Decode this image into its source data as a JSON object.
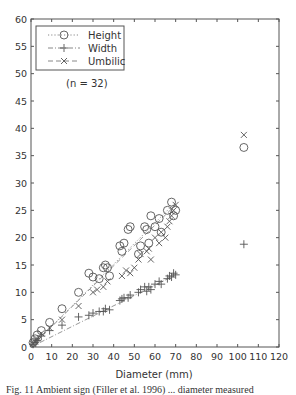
{
  "chart_data": {
    "type": "scatter",
    "title": "",
    "xlabel": "Diameter (mm)",
    "ylabel": "",
    "xlim": [
      0,
      120
    ],
    "ylim": [
      0,
      60
    ],
    "xticks": [
      0,
      10,
      20,
      30,
      40,
      50,
      60,
      70,
      80,
      90,
      100,
      110,
      120
    ],
    "yticks": [
      0,
      5,
      10,
      15,
      20,
      25,
      30,
      35,
      40,
      45,
      50,
      55,
      60
    ],
    "grid": false,
    "legend_position": "upper left",
    "annotation": "(n = 32)",
    "series": [
      {
        "name": "Height",
        "marker": "circle",
        "line": "dotted",
        "x": [
          1,
          2,
          3,
          5,
          9,
          15,
          23,
          28,
          30,
          33,
          35,
          36,
          37,
          38,
          43,
          44,
          45,
          47,
          48,
          52,
          53,
          55,
          56,
          57,
          58,
          60,
          62,
          63,
          66,
          68,
          69,
          70,
          103
        ],
        "y": [
          0.8,
          1.5,
          2.2,
          3,
          4.5,
          7,
          10,
          13.5,
          12.8,
          12.5,
          14.5,
          15,
          14.5,
          13,
          18.5,
          17.5,
          19,
          21.5,
          22,
          17,
          18.5,
          22,
          21.5,
          19,
          24,
          22,
          23.5,
          21,
          25,
          26.5,
          24,
          25,
          36.5
        ]
      },
      {
        "name": "Width",
        "marker": "plus",
        "line": "dash-dot",
        "x": [
          1,
          2,
          3,
          5,
          9,
          15,
          23,
          28,
          30,
          33,
          35,
          36,
          38,
          43,
          44,
          45,
          47,
          48,
          52,
          53,
          55,
          56,
          57,
          58,
          60,
          62,
          63,
          66,
          67,
          68,
          69,
          70,
          103
        ],
        "y": [
          0.5,
          0.8,
          1.2,
          2,
          3,
          4,
          5.5,
          5.8,
          6.2,
          6.5,
          6.5,
          7,
          6.8,
          8.5,
          8.8,
          9,
          9,
          9.5,
          10,
          10.5,
          11,
          10.2,
          11,
          10.5,
          11.5,
          12,
          11.5,
          12.5,
          13,
          12.8,
          13.5,
          13.2,
          18.8
        ]
      },
      {
        "name": "Umbilic",
        "marker": "x",
        "line": "dashed",
        "x": [
          1,
          2,
          3,
          5,
          9,
          15,
          23,
          30,
          32,
          35,
          37,
          44,
          46,
          48,
          50,
          52,
          53,
          56,
          57,
          58,
          60,
          62,
          63,
          65,
          66,
          67,
          68,
          69,
          70,
          103
        ],
        "y": [
          0.6,
          1,
          1.5,
          2.5,
          3.5,
          5,
          7.5,
          10,
          10.5,
          11,
          12,
          13,
          14,
          13.5,
          14.5,
          16,
          17,
          17.5,
          18,
          16,
          20,
          19,
          21,
          20,
          22,
          23,
          24,
          25,
          26,
          38.8
        ]
      }
    ],
    "fit_lines": [
      {
        "name": "Height",
        "style": "dotted",
        "from": [
          0,
          0
        ],
        "to": [
          70,
          26.5
        ]
      },
      {
        "name": "Width",
        "style": "dash-dot",
        "from": [
          0,
          0
        ],
        "to": [
          70,
          13.2
        ]
      },
      {
        "name": "Umbilic",
        "style": "dashed",
        "from": [
          0,
          0
        ],
        "to": [
          70,
          26
        ]
      }
    ]
  },
  "legend": {
    "items": [
      {
        "label": "Height",
        "marker": "circle",
        "line": "dotted"
      },
      {
        "label": "Width",
        "marker": "plus",
        "line": "dash-dot"
      },
      {
        "label": "Umbilic",
        "marker": "x",
        "line": "dashed"
      }
    ]
  },
  "annotation_text": "(n = 32)",
  "caption": "Fig. 11  Ambient sign (Filler et al. 1996) ... diameter measured"
}
